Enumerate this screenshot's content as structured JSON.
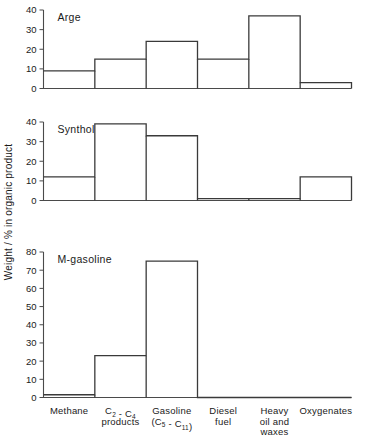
{
  "chart_data": {
    "type": "bar",
    "title": "",
    "xlabel": "",
    "ylabel": "Weight / % in organic product",
    "categories": [
      "Methane",
      "C₂ – C₄ products",
      "Gasoline (C₅–C₁₁)",
      "Diesel fuel",
      "Heavy oil and waxes",
      "Oxygenates"
    ],
    "category_lines": [
      [
        "Methane"
      ],
      [
        "C2 - C4",
        "products"
      ],
      [
        "Gasoline",
        "(C5 - C11)"
      ],
      [
        "Diesel",
        "fuel"
      ],
      [
        "Heavy",
        "oil and",
        "waxes"
      ],
      [
        "Oxygenates"
      ]
    ],
    "grid": false,
    "legend_position": "none",
    "panels": [
      {
        "name": "Arge",
        "ylim": [
          0,
          40
        ],
        "yticks": [
          0,
          10,
          20,
          30,
          40
        ],
        "values": [
          9,
          15,
          24,
          15,
          37,
          3
        ]
      },
      {
        "name": "Synthol",
        "ylim": [
          0,
          40
        ],
        "yticks": [
          0,
          10,
          20,
          30,
          40
        ],
        "values": [
          12,
          39,
          33,
          1,
          1,
          12
        ]
      },
      {
        "name": "M-gasoline",
        "ylim": [
          0,
          80
        ],
        "yticks": [
          0,
          10,
          20,
          30,
          40,
          50,
          60,
          70,
          80
        ],
        "values": [
          1.5,
          23,
          75,
          0,
          0,
          0
        ]
      }
    ]
  }
}
